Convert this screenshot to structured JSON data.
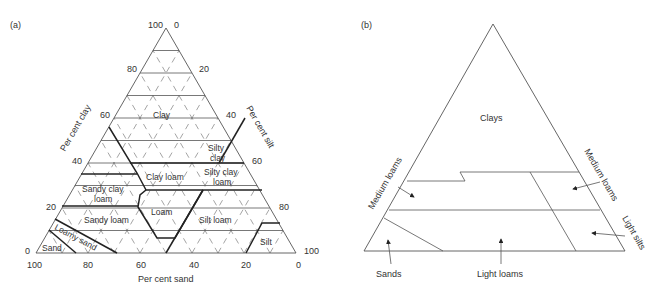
{
  "panel_a": {
    "label": "(a)",
    "axes": {
      "clay": "Per cent clay",
      "silt": "Per cent silt",
      "sand": "Per cent sand"
    },
    "ticks": {
      "clay": [
        "0",
        "20",
        "40",
        "60",
        "80",
        "100"
      ],
      "silt": [
        "0",
        "20",
        "40",
        "60",
        "80",
        "100"
      ],
      "sand": [
        "100",
        "80",
        "60",
        "40",
        "20",
        "0"
      ]
    },
    "classes": {
      "clay": "Clay",
      "silty_clay_1": "Silty",
      "silty_clay_2": "clay",
      "clay_loam": "Clay loam",
      "silty_clay_loam_1": "Silty clay",
      "silty_clay_loam_2": "loam",
      "sandy_clay_loam_1": "Sandy clay",
      "sandy_clay_loam_2": "loam",
      "loam": "Loam",
      "sandy_loam": "Sandy loam",
      "silt_loam": "Silt loam",
      "loamy_sand": "Loamy sand",
      "sand": "Sand",
      "silt": "Silt"
    }
  },
  "panel_b": {
    "label": "(b)",
    "classes": {
      "clays": "Clays",
      "medium_loams_left": "Medium loams",
      "medium_loams_right": "Medium loams",
      "light_silts": "Light silts",
      "sands": "Sands",
      "light_loams": "Light loams"
    }
  }
}
